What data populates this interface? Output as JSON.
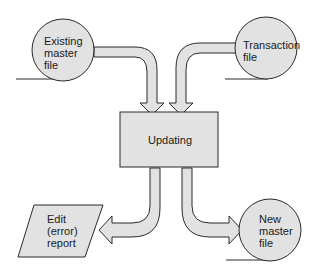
{
  "diagram": {
    "colors": {
      "fill": "#e2e2e2",
      "stroke": "#2a2a2a",
      "background": "#ffffff"
    },
    "nodes": [
      {
        "id": "existing",
        "shape": "circle",
        "lines": [
          "Existing",
          "master",
          "file"
        ]
      },
      {
        "id": "transaction",
        "shape": "circle",
        "lines": [
          "Transaction",
          "file"
        ]
      },
      {
        "id": "updating",
        "shape": "rectangle",
        "lines": [
          "Updating"
        ]
      },
      {
        "id": "edit",
        "shape": "parallelogram",
        "lines": [
          "Edit",
          "(error)",
          "report"
        ]
      },
      {
        "id": "newmaster",
        "shape": "circle",
        "lines": [
          "New",
          "master",
          "file"
        ]
      }
    ],
    "edges": [
      {
        "from": "existing",
        "to": "updating"
      },
      {
        "from": "transaction",
        "to": "updating"
      },
      {
        "from": "updating",
        "to": "edit"
      },
      {
        "from": "updating",
        "to": "newmaster"
      }
    ]
  }
}
